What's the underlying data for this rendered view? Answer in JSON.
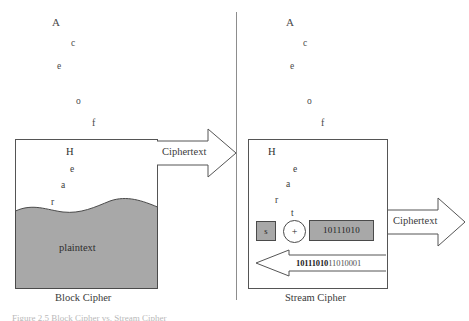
{
  "figure": {
    "divider_color": "#8d8d8d",
    "fill_gray": "#a8a8a8",
    "line_color": "#555555"
  },
  "left_panel": {
    "caption": "Block Cipher",
    "floating_letters": [
      {
        "char": "A",
        "x": 52,
        "y": 17,
        "size": 11
      },
      {
        "char": "c",
        "x": 71,
        "y": 39,
        "size": 9.5
      },
      {
        "char": "e",
        "x": 57,
        "y": 62,
        "size": 9.5
      },
      {
        "char": "o",
        "x": 76,
        "y": 97,
        "size": 9.5
      },
      {
        "char": "f",
        "x": 92,
        "y": 118,
        "size": 10
      }
    ],
    "box_letters": [
      {
        "char": "H",
        "x": 66,
        "y": 147,
        "size": 10.5
      },
      {
        "char": "e",
        "x": 70,
        "y": 165,
        "size": 9.5
      },
      {
        "char": "a",
        "x": 61,
        "y": 181,
        "size": 9.5
      },
      {
        "char": "r",
        "x": 51,
        "y": 198,
        "size": 9.5
      }
    ],
    "plaintext_label": "plaintext",
    "arrow_label": "Ciphertext"
  },
  "right_panel": {
    "caption": "Stream Cipher",
    "floating_letters": [
      {
        "char": "A",
        "x": 286,
        "y": 17,
        "size": 11
      },
      {
        "char": "c",
        "x": 303,
        "y": 39,
        "size": 9.5
      },
      {
        "char": "e",
        "x": 290,
        "y": 62,
        "size": 9.5
      },
      {
        "char": "o",
        "x": 307,
        "y": 97,
        "size": 9.5
      },
      {
        "char": "f",
        "x": 321,
        "y": 118,
        "size": 10
      }
    ],
    "box_letters": [
      {
        "char": "H",
        "x": 268,
        "y": 147,
        "size": 10.5
      },
      {
        "char": "e",
        "x": 293,
        "y": 165,
        "size": 9.5
      },
      {
        "char": "a",
        "x": 286,
        "y": 180,
        "size": 9.5
      },
      {
        "char": "r",
        "x": 275,
        "y": 196,
        "size": 9.5
      },
      {
        "char": "t",
        "x": 291,
        "y": 209,
        "size": 9.5
      }
    ],
    "key_chip_label": "s",
    "xor_symbol": "+",
    "keystream_chip_label": "10111010",
    "feedback_bold": "10111010",
    "feedback_rest": "11010001",
    "arrow_label": "Ciphertext"
  },
  "bottom_caption": "Figure 2.5  Block Cipher vs. Stream Cipher"
}
